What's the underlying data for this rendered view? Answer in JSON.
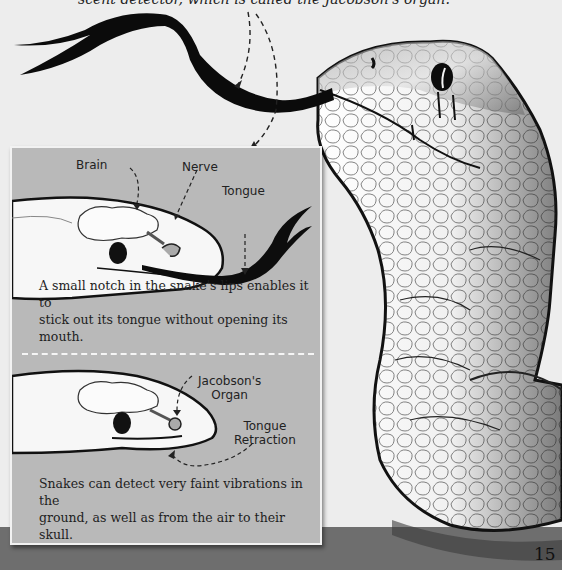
{
  "page": {
    "intro_text": "scent detector, which is called the Jacobson's organ.",
    "page_number": "15"
  },
  "panel_top": {
    "labels": {
      "brain": "Brain",
      "nerve": "Nerve",
      "tongue": "Tongue"
    },
    "caption_line1": "A small notch in the snake's lips enables it to",
    "caption_line2": "stick out its tongue without opening its mouth."
  },
  "panel_bottom": {
    "labels": {
      "jacobsons_line1": "Jacobson's",
      "jacobsons_line2": "Organ",
      "retraction_line1": "Tongue",
      "retraction_line2": "Retraction"
    },
    "caption_line1": "Snakes can detect very faint vibrations in the",
    "caption_line2": "ground, as well as from the air to their skull."
  },
  "colors": {
    "page_bg": "#ededed",
    "panel_bg": "#b9b9b9",
    "ground": "#6e6e6e",
    "ink": "#111111"
  }
}
